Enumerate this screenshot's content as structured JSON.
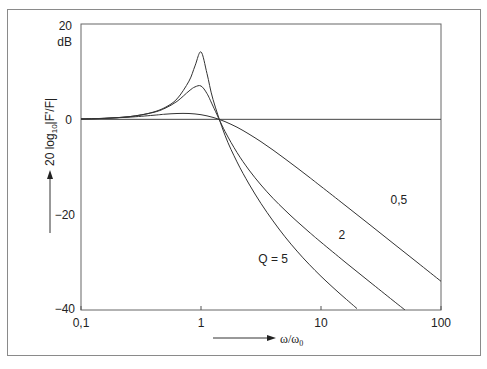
{
  "chart_data": {
    "type": "line",
    "title": "",
    "xlabel": "ω/ω0",
    "ylabel": "20 log10|F'/F|",
    "y_unit": "dB",
    "xscale": "log",
    "xlim": [
      0.1,
      100
    ],
    "ylim": [
      -40,
      20
    ],
    "grid": false,
    "legend": "inline curve labels",
    "x_ticks": [
      0.1,
      1,
      10,
      100
    ],
    "x_tick_labels": [
      "0,1",
      "1",
      "10",
      "100"
    ],
    "y_ticks": [
      20,
      0,
      -20,
      -40
    ],
    "y_tick_labels": [
      "20",
      "0",
      "−20",
      "−40"
    ],
    "reference_line": {
      "y": 0,
      "label": "0 dB"
    },
    "series": [
      {
        "name": "Q = 5",
        "label": "Q = 5",
        "label_pos": [
          3.0,
          -30.2
        ],
        "x": [
          0.1,
          0.126,
          0.158,
          0.2,
          0.251,
          0.316,
          0.398,
          0.501,
          0.631,
          0.794,
          0.891,
          1.0,
          1.122,
          1.259,
          1.585,
          1.995,
          2.512,
          3.162,
          3.981,
          5.012,
          6.31,
          7.943,
          10,
          12.59,
          15.85,
          19.95
        ],
        "values": [
          0.09,
          0.14,
          0.22,
          0.35,
          0.56,
          0.91,
          1.49,
          2.48,
          4.29,
          8.03,
          11.2,
          14.15,
          9.6,
          4.19,
          -3.36,
          -8.92,
          -13.56,
          -17.65,
          -21.31,
          -24.64,
          -27.65,
          -30.4,
          -32.92,
          -35.29,
          -37.53,
          -39.7
        ]
      },
      {
        "name": "Q = 2",
        "label": "2",
        "label_pos": [
          14.0,
          -25.2
        ],
        "x": [
          0.1,
          0.158,
          0.251,
          0.398,
          0.501,
          0.631,
          0.794,
          0.891,
          1.0,
          1.122,
          1.259,
          1.585,
          1.995,
          2.512,
          3.162,
          3.981,
          5.012,
          6.31,
          7.943,
          10,
          15.85,
          25.12,
          39.81,
          50.12
        ],
        "values": [
          0.09,
          0.22,
          0.56,
          1.43,
          2.32,
          3.77,
          5.95,
          6.8,
          6.99,
          5.4,
          2.77,
          -2.53,
          -6.95,
          -10.63,
          -13.78,
          -16.56,
          -19.07,
          -21.41,
          -23.63,
          -25.77,
          -29.92,
          -33.97,
          -38.0,
          -40.0
        ]
      },
      {
        "name": "Q = 0,5",
        "label": "0,5",
        "label_pos": [
          38.0,
          -17.8
        ],
        "x": [
          0.1,
          0.158,
          0.251,
          0.398,
          0.501,
          0.631,
          0.794,
          1.0,
          1.259,
          1.585,
          1.995,
          2.512,
          3.162,
          3.981,
          5.012,
          6.31,
          7.943,
          10,
          15.85,
          25.12,
          39.81,
          63.1,
          100
        ],
        "values": [
          0.08,
          0.2,
          0.45,
          0.85,
          1.07,
          1.23,
          1.22,
          0.97,
          0.41,
          -0.48,
          -1.66,
          -3.09,
          -4.7,
          -6.44,
          -8.27,
          -10.17,
          -12.1,
          -14.06,
          -18.01,
          -21.98,
          -25.99,
          -29.98,
          -33.98
        ]
      }
    ]
  },
  "axes": {
    "y_unit_label": "dB",
    "y_axis_title_main": "20 log",
    "y_axis_title_sub": "10",
    "y_axis_title_tail": "|F'/F|",
    "x_axis_title_main": "ω/ω",
    "x_axis_title_sub": "0"
  }
}
